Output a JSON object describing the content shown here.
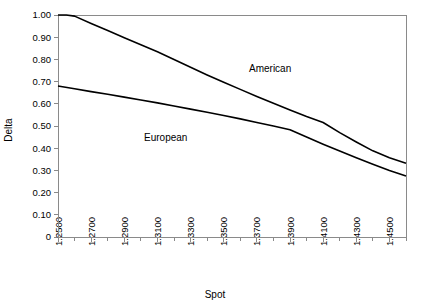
{
  "chart_data": {
    "type": "line",
    "title": "",
    "xlabel": "Spot",
    "ylabel": "Delta",
    "xlim": [
      1.25,
      1.46
    ],
    "ylim": [
      0,
      1.0
    ],
    "grid": false,
    "legend_position": "inline-annotations",
    "x_tick_labels": [
      "1.2500",
      "1.2700",
      "1.2900",
      "1.3100",
      "1.3300",
      "1.3500",
      "1.3700",
      "1.3900",
      "1.4100",
      "1.4300",
      "1.4500"
    ],
    "x_tick_values": [
      1.25,
      1.27,
      1.29,
      1.31,
      1.33,
      1.35,
      1.37,
      1.39,
      1.41,
      1.43,
      1.45
    ],
    "x_minor_tick_values": [
      1.26,
      1.28,
      1.3,
      1.32,
      1.34,
      1.36,
      1.38,
      1.4,
      1.42,
      1.44,
      1.46
    ],
    "y_tick_labels": [
      "1.00",
      "0.90",
      "0.80",
      "0.70",
      "0.60",
      "0.50",
      "0.40",
      "0.30",
      "0.20",
      "0.10",
      "0"
    ],
    "y_tick_values": [
      1.0,
      0.9,
      0.8,
      0.7,
      0.6,
      0.5,
      0.4,
      0.3,
      0.2,
      0.1,
      0
    ],
    "series": [
      {
        "name": "American",
        "color": "#000000",
        "annotation": "American",
        "x": [
          1.25,
          1.255,
          1.26,
          1.27,
          1.28,
          1.29,
          1.3,
          1.31,
          1.32,
          1.33,
          1.34,
          1.35,
          1.36,
          1.37,
          1.38,
          1.39,
          1.4,
          1.41,
          1.42,
          1.43,
          1.44,
          1.45,
          1.46
        ],
        "values": [
          1.0,
          1.0,
          0.995,
          0.962,
          0.93,
          0.898,
          0.866,
          0.834,
          0.8,
          0.765,
          0.73,
          0.697,
          0.665,
          0.633,
          0.602,
          0.572,
          0.543,
          0.516,
          0.47,
          0.428,
          0.388,
          0.357,
          0.332
        ]
      },
      {
        "name": "European",
        "color": "#000000",
        "annotation": "European",
        "x": [
          1.25,
          1.26,
          1.27,
          1.28,
          1.29,
          1.3,
          1.31,
          1.32,
          1.33,
          1.34,
          1.35,
          1.36,
          1.37,
          1.38,
          1.39,
          1.4,
          1.41,
          1.42,
          1.43,
          1.44,
          1.45,
          1.46
        ],
        "values": [
          0.68,
          0.668,
          0.655,
          0.643,
          0.63,
          0.617,
          0.604,
          0.59,
          0.576,
          0.562,
          0.547,
          0.532,
          0.516,
          0.5,
          0.483,
          0.45,
          0.418,
          0.387,
          0.357,
          0.328,
          0.3,
          0.275
        ]
      }
    ],
    "annotations": [
      {
        "name": "American",
        "text": "American",
        "x": 1.378,
        "y": 0.745
      },
      {
        "name": "European",
        "text": "European",
        "x": 1.315,
        "y": 0.432
      }
    ]
  },
  "axes": {
    "x_title": "Spot",
    "y_title": "Delta"
  }
}
